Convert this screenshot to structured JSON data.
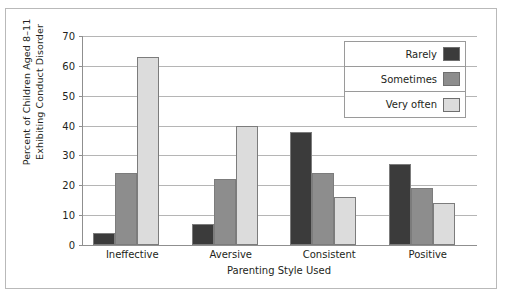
{
  "chart_data": {
    "type": "bar",
    "title": "",
    "xlabel": "Parenting Style Used",
    "ylabel_lines": [
      "Percent of Children Aged 8–11",
      "Exhibiting Conduct Disorder"
    ],
    "ylabel": "Percent of Children Aged 8–11 Exhibiting Conduct Disorder",
    "categories": [
      "Ineffective",
      "Aversive",
      "Consistent",
      "Positive"
    ],
    "series": [
      {
        "name": "Rarely",
        "color": "#3b3b3b",
        "values": [
          4,
          7,
          38,
          27
        ]
      },
      {
        "name": "Sometimes",
        "color": "#8d8d8d",
        "values": [
          24,
          22,
          24,
          19
        ]
      },
      {
        "name": "Very often",
        "color": "#dcdcdc",
        "values": [
          63,
          40,
          16,
          14
        ]
      }
    ],
    "ylim": [
      0,
      70
    ],
    "yticks": [
      0,
      10,
      20,
      30,
      40,
      50,
      60,
      70
    ],
    "ytick_labels": [
      "0",
      "10",
      "20",
      "30",
      "40",
      "50",
      "60",
      "70"
    ],
    "grid": true,
    "legend_position": "top-right"
  },
  "legend": {
    "entries": [
      {
        "label": "Rarely"
      },
      {
        "label": "Sometimes"
      },
      {
        "label": "Very often"
      }
    ]
  }
}
